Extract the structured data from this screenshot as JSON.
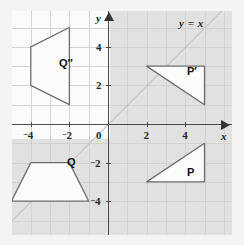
{
  "figure": {
    "kind": "coordinate-plane",
    "line_label": "y = x",
    "x_axis_name": "x",
    "y_axis_name": "y",
    "origin_label": "0"
  },
  "axes": {
    "x_ticks": [
      {
        "value": -4,
        "neg": "–",
        "text": "4"
      },
      {
        "value": -2,
        "neg": "–",
        "text": "2"
      },
      {
        "value": 2,
        "neg": "",
        "text": "2"
      },
      {
        "value": 4,
        "neg": "",
        "text": "4"
      }
    ],
    "y_ticks": [
      {
        "value": 4,
        "neg": "",
        "text": "4"
      },
      {
        "value": 2,
        "neg": "",
        "text": "2"
      },
      {
        "value": -2,
        "neg": "–",
        "text": "2"
      },
      {
        "value": -4,
        "neg": "–",
        "text": "4"
      }
    ]
  },
  "shapes": {
    "p": {
      "label": "P",
      "vertices": [
        [
          2,
          -3
        ],
        [
          5,
          -3
        ],
        [
          5,
          -1
        ]
      ]
    },
    "p_prime": {
      "label": "P′",
      "vertices": [
        [
          2,
          3
        ],
        [
          5,
          3
        ],
        [
          5,
          1
        ]
      ]
    },
    "q": {
      "label": "Q",
      "vertices": [
        [
          -5,
          -4
        ],
        [
          -1,
          -4
        ],
        [
          -2,
          -2
        ],
        [
          -4,
          -2
        ]
      ]
    },
    "q_dprime": {
      "label": "Q″",
      "vertices": [
        [
          -2,
          5
        ],
        [
          -4,
          4
        ],
        [
          -4,
          2
        ],
        [
          -2,
          1
        ]
      ]
    }
  },
  "chart_data": {
    "type": "scatter",
    "title": "",
    "xlabel": "x",
    "ylabel": "y",
    "xlim": [
      -5.6,
      6.8
    ],
    "ylim": [
      -5.9,
      5.9
    ],
    "grid": true,
    "annotations": [
      "y = x",
      "P",
      "P′",
      "Q",
      "Q″"
    ],
    "series": [
      {
        "name": "P",
        "type": "polygon",
        "points": [
          [
            2,
            -3
          ],
          [
            5,
            -3
          ],
          [
            5,
            -1
          ]
        ]
      },
      {
        "name": "P'",
        "type": "polygon",
        "points": [
          [
            2,
            3
          ],
          [
            5,
            3
          ],
          [
            5,
            1
          ]
        ]
      },
      {
        "name": "Q",
        "type": "polygon",
        "points": [
          [
            -5,
            -4
          ],
          [
            -1,
            -4
          ],
          [
            -2,
            -2
          ],
          [
            -4,
            -2
          ]
        ]
      },
      {
        "name": "Q''",
        "type": "polygon",
        "points": [
          [
            -2,
            5
          ],
          [
            -4,
            4
          ],
          [
            -4,
            2
          ],
          [
            -2,
            1
          ]
        ]
      },
      {
        "name": "y = x",
        "type": "line",
        "points": [
          [
            -5.6,
            -5.6
          ],
          [
            5.9,
            5.9
          ]
        ]
      }
    ]
  }
}
